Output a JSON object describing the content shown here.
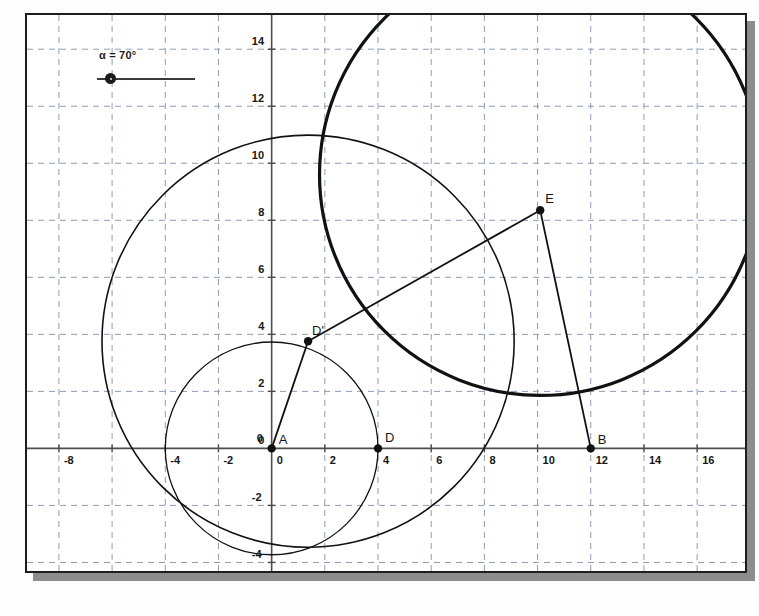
{
  "app": {
    "type": "geometry-applet",
    "background_color": "#ffffff",
    "frame_border_color": "#1d1d1d",
    "shadow_color": "#8d8d8d"
  },
  "slider": {
    "name": "alpha",
    "label": "α = 70°",
    "value": 70,
    "unit": "degrees",
    "knob_position_pct": 8
  },
  "chart_data": {
    "type": "scatter",
    "title": "",
    "xlabel": "",
    "ylabel": "",
    "grid": true,
    "legend": "none",
    "xlim": [
      -9.2,
      17.8
    ],
    "ylim": [
      -4.3,
      15.2
    ],
    "x_ticks": [
      -8,
      -6,
      -4,
      -2,
      0,
      2,
      4,
      6,
      8,
      10,
      12,
      14,
      16
    ],
    "x_tick_labels": [
      "-8",
      "-6",
      "-4",
      "-2",
      "0",
      "2",
      "4",
      "6",
      "8",
      "10",
      "12",
      "14",
      "16"
    ],
    "x_tick_labels_shown": [
      "-8",
      "-4",
      "-2",
      "0",
      "2",
      "4",
      "6",
      "8",
      "10",
      "12",
      "14",
      "16"
    ],
    "y_ticks": [
      -4,
      -2,
      0,
      2,
      4,
      6,
      8,
      10,
      12,
      14
    ],
    "y_tick_labels": [
      "-4",
      "-2",
      "0",
      "2",
      "4",
      "6",
      "8",
      "10",
      "12",
      "14"
    ],
    "points": [
      {
        "label": "A",
        "x": 0,
        "y": 0,
        "label_dx": 7,
        "label_dy": -16
      },
      {
        "label": "D",
        "x": 4,
        "y": 0,
        "label_dx": 7,
        "label_dy": -18
      },
      {
        "label": "B",
        "x": 12,
        "y": 0,
        "label_dx": 7,
        "label_dy": -16
      },
      {
        "label": "D'",
        "x": 1.37,
        "y": 3.76,
        "label_dx": 4,
        "label_dy": -18
      },
      {
        "label": "E",
        "x": 10.1,
        "y": 8.35,
        "label_dx": 5,
        "label_dy": -19
      }
    ],
    "origin_zero_marks": [
      "0",
      "0"
    ],
    "circles": [
      {
        "name": "circle-A",
        "cx": 0,
        "cy": 0,
        "r": 4.0,
        "stroke_width": 1.3
      },
      {
        "name": "circle-Dp",
        "cx": 1.37,
        "cy": 3.76,
        "r": 7.75,
        "stroke_width": 1.6
      },
      {
        "name": "circle-E",
        "cx": 10.1,
        "cy": 9.6,
        "r": 8.3,
        "stroke_width": 3.2
      }
    ],
    "segments": [
      {
        "name": "segment-A-Dp",
        "x1": 0,
        "y1": 0,
        "x2": 1.37,
        "y2": 3.76
      },
      {
        "name": "segment-Dp-E",
        "x1": 1.37,
        "y1": 3.76,
        "x2": 10.1,
        "y2": 8.35
      },
      {
        "name": "segment-E-B",
        "x1": 10.1,
        "y1": 8.35,
        "x2": 12,
        "y2": 0
      }
    ],
    "colors": {
      "curve": "#111111",
      "axis": "#4d4d4d",
      "grid": "#8f9bb3",
      "point": "#111111",
      "text": "#161616"
    }
  }
}
